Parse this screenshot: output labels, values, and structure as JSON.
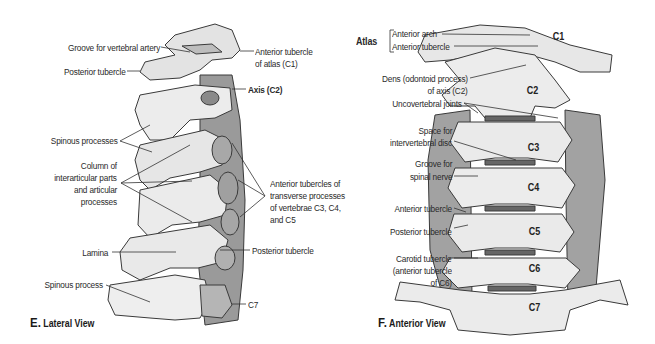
{
  "panels": {
    "lateral": {
      "letter": "E.",
      "title": "Lateral View",
      "labels": {
        "groove_vertebral_artery": "Groove for vertebral artery",
        "posterior_tubercle_top": "Posterior tubercle",
        "anterior_tubercle_atlas_1": "Anterior tubercle",
        "anterior_tubercle_atlas_2": "of atlas (C1)",
        "axis": "Axis (C2)",
        "spinous_processes": "Spinous processes",
        "column_1": "Column of",
        "column_2": "interarticular parts",
        "column_3": "and articular",
        "column_4": "processes",
        "anterior_tubercles_1": "Anterior tubercles of",
        "anterior_tubercles_2": "transverse processes",
        "anterior_tubercles_3": "of vertebrae C3, C4,",
        "anterior_tubercles_4": "and C5",
        "lamina": "Lamina",
        "posterior_tubercle_bottom": "Posterior tubercle",
        "spinous_process": "Spinous process",
        "c7": "C7"
      }
    },
    "anterior": {
      "letter": "F.",
      "title": "Anterior View",
      "labels": {
        "atlas": "Atlas",
        "anterior_arch": "Anterior arch",
        "anterior_tubercle_atlas": "Anterior tubercle",
        "dens_1": "Dens (odontoid process)",
        "dens_2": "of axis (C2)",
        "uncovertebral": "Uncovertebral joints",
        "space_disc_1": "Space for",
        "space_disc_2": "intervertebral disc",
        "groove_nerve_1": "Groove for",
        "groove_nerve_2": "spinal nerve",
        "anterior_tubercle": "Anterior tubercle",
        "posterior_tubercle": "Posterior tubercle",
        "carotid_1": "Carotid tubercle",
        "carotid_2": "(anterior tubercle",
        "carotid_3": "of C6)"
      },
      "vertebrae": [
        "C1",
        "C2",
        "C3",
        "C4",
        "C5",
        "C6",
        "C7"
      ]
    }
  },
  "colors": {
    "bone_light": "#ececec",
    "bone_mid": "#c9c9c9",
    "bone_dark": "#8e8e8e",
    "outline": "#3a3a3a",
    "leader": "#333333"
  }
}
